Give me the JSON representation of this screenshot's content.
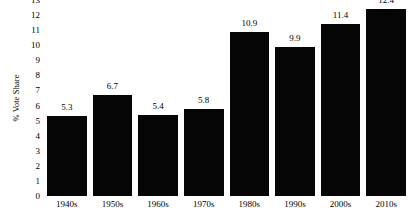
{
  "chart_data": {
    "type": "bar",
    "title": "",
    "subtitle": "",
    "xlabel": "",
    "ylabel": "% Vote Share",
    "categories": [
      "1940s",
      "1950s",
      "1960s",
      "1970s",
      "1980s",
      "1990s",
      "2000s",
      "2010s"
    ],
    "values": [
      5.3,
      6.7,
      5.4,
      5.8,
      10.9,
      9.9,
      11.4,
      12.4
    ],
    "value_labels": [
      "5.3",
      "6.7",
      "5.4",
      "5.8",
      "10.9",
      "9.9",
      "11.4",
      "12.4"
    ],
    "ylim": [
      0,
      13
    ],
    "ytick_labels": [
      "0",
      "1",
      "2",
      "3",
      "4",
      "5",
      "6",
      "7",
      "8",
      "9",
      "10",
      "11",
      "12",
      "13"
    ],
    "ytick_values": [
      0,
      1,
      2,
      3,
      4,
      5,
      6,
      7,
      8,
      9,
      10,
      11,
      12,
      13
    ],
    "grid": false,
    "legend": false,
    "legend_position": "none",
    "bar_color": "#050505",
    "background_color": "#ffffff",
    "text_color": "#000000"
  }
}
